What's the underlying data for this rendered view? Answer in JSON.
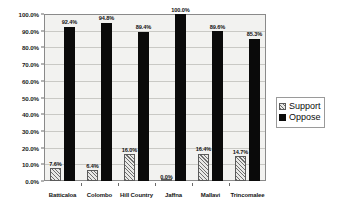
{
  "chart_data": {
    "type": "bar",
    "title": "",
    "subtitle": "",
    "xlabel": "",
    "ylabel": "",
    "ylim": [
      0,
      100
    ],
    "grid": true,
    "legend_position": "right",
    "categories": [
      "Batticaloa",
      "Colombo",
      "Hill Country",
      "Jaffna",
      "Mallavi",
      "Trincomalee"
    ],
    "ytick_labels": [
      "100.0%",
      "90.0%",
      "80.0%",
      "70.0%",
      "60.0%",
      "50.0%",
      "40.0%",
      "30.0%",
      "20.0%",
      "10.0%",
      "0.0%"
    ],
    "ytick_values": [
      100,
      90,
      80,
      70,
      60,
      50,
      40,
      30,
      20,
      10,
      0
    ],
    "series": [
      {
        "name": "Support",
        "values": [
          7.6,
          6.4,
          16.0,
          0.0,
          16.4,
          14.7
        ],
        "labels": [
          "7.6%",
          "6.4%",
          "16.0%",
          "0.0%",
          "16.4%",
          "14.7%"
        ],
        "color": "#e8e8e6",
        "pattern": "diagonal-hatch"
      },
      {
        "name": "Oppose",
        "values": [
          92.4,
          94.8,
          89.4,
          100.0,
          89.6,
          85.3
        ],
        "labels": [
          "92.4%",
          "94.8%",
          "89.4%",
          "100.0%",
          "89.6%",
          "85.3%"
        ],
        "color": "#0a0a0a",
        "pattern": "solid"
      }
    ]
  },
  "legend": {
    "items": [
      {
        "label": "Support",
        "swatch": "hatched-swatch-icon"
      },
      {
        "label": "Oppose",
        "swatch": "solid-swatch-icon"
      }
    ]
  }
}
